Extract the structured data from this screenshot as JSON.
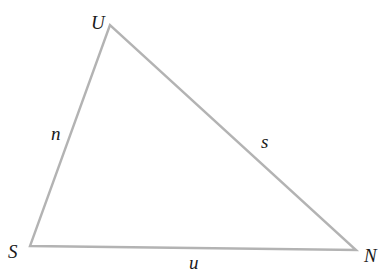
{
  "diagram": {
    "type": "triangle",
    "stroke_color": "#b3b3b3",
    "label_color": "#1a1a1a",
    "vertices": [
      {
        "name": "U",
        "x": 110,
        "y": 25,
        "label_x": 91,
        "label_y": 29
      },
      {
        "name": "S",
        "x": 30,
        "y": 246,
        "label_x": 8,
        "label_y": 258
      },
      {
        "name": "N",
        "x": 356,
        "y": 250,
        "label_x": 364,
        "label_y": 262
      }
    ],
    "sides": [
      {
        "name": "n",
        "from": "S",
        "to": "U",
        "label_x": 51,
        "label_y": 140
      },
      {
        "name": "s",
        "from": "U",
        "to": "N",
        "label_x": 261,
        "label_y": 148
      },
      {
        "name": "u",
        "from": "S",
        "to": "N",
        "label_x": 189,
        "label_y": 269
      }
    ]
  }
}
